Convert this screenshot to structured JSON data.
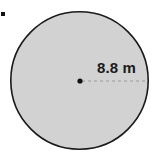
{
  "figure": {
    "type": "geometry-diagram",
    "shape_name": "circle",
    "background_color": "#ffffff",
    "canvas": {
      "width": 157,
      "height": 161
    },
    "circle": {
      "fill_color": "#d2d2d2",
      "stroke_color": "#1a1a1a",
      "stroke_width": 1.6,
      "center_x": 79.5,
      "center_y": 80.5,
      "radius": 69.5
    },
    "center_point": {
      "label": "center-dot",
      "x": 80,
      "y": 81,
      "radius": 2.6,
      "color": "#111111"
    },
    "radius_segment": {
      "from_x": 82,
      "to_x": 148,
      "y": 81,
      "stroke_color": "#9a9a9a",
      "dash_pattern": "3 3",
      "stroke_width": 1
    },
    "measurement": {
      "label": "8.8 m",
      "value": 8.8,
      "unit": "m",
      "quantity": "radius",
      "text_color": "#1b1b1b"
    },
    "corner_mark": {
      "name": "bullet-mark",
      "color": "#111111"
    }
  }
}
